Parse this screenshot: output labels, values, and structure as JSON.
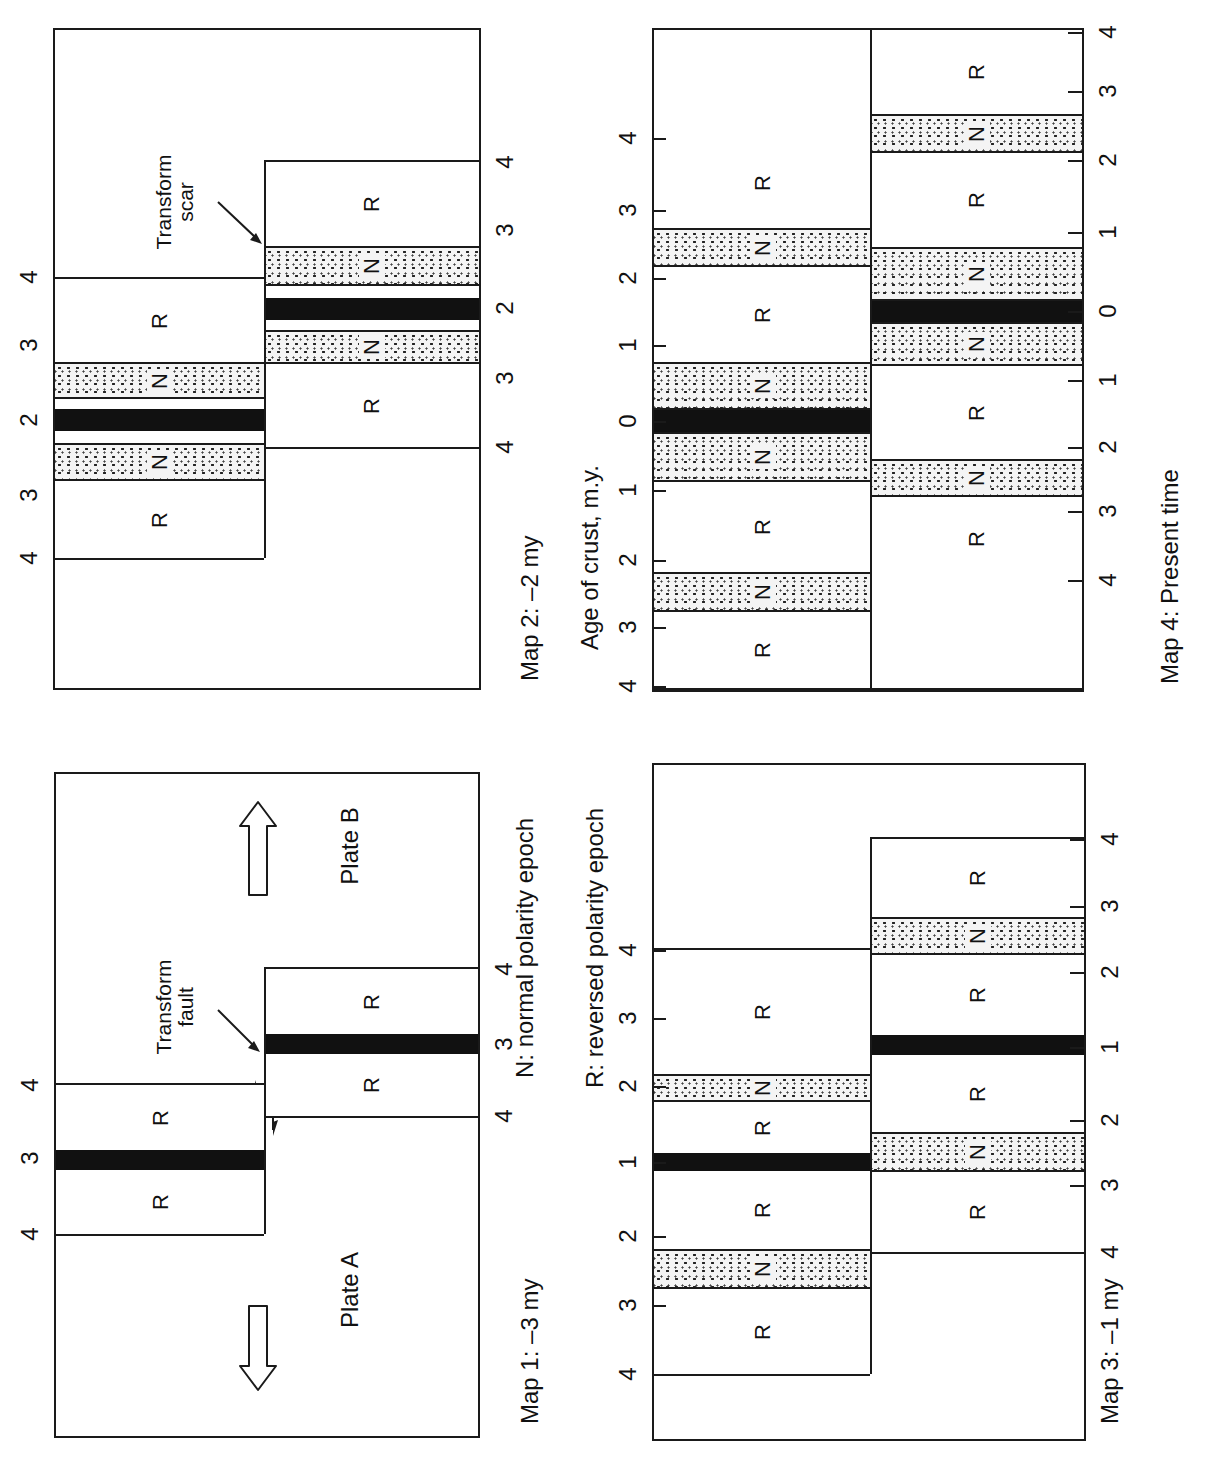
{
  "legend": {
    "normal": "N:  normal polarity epoch",
    "reversed": "R:  reversed polarity epoch"
  },
  "axis_title": "Age of crust, m.y.",
  "maps": [
    {
      "id": "map2",
      "caption": "Map 2:  –2 my",
      "box": {
        "x": 53,
        "y": 28,
        "w": 428,
        "h": 662
      },
      "fault_x": 264,
      "left_plate": {
        "y_top": 277,
        "y_bottom": 558
      },
      "right_plate": {
        "y_top": 160,
        "y_bottom": 447
      },
      "stripes_left": [
        {
          "type": "R",
          "y": 279,
          "h": 83,
          "label": "R"
        },
        {
          "type": "N",
          "y": 362,
          "h": 37,
          "label": "N"
        },
        {
          "type": "R",
          "y": 399,
          "h": 10,
          "label": ""
        },
        {
          "type": "B",
          "y": 409,
          "h": 22,
          "label": ""
        },
        {
          "type": "R",
          "y": 431,
          "h": 12,
          "label": ""
        },
        {
          "type": "N",
          "y": 443,
          "h": 38,
          "label": "N"
        },
        {
          "type": "R",
          "y": 481,
          "h": 77,
          "label": "R"
        }
      ],
      "stripes_right": [
        {
          "type": "R",
          "y": 162,
          "h": 84,
          "label": "R"
        },
        {
          "type": "N",
          "y": 246,
          "h": 40,
          "label": "N"
        },
        {
          "type": "R",
          "y": 286,
          "h": 12,
          "label": ""
        },
        {
          "type": "B",
          "y": 298,
          "h": 22,
          "label": ""
        },
        {
          "type": "R",
          "y": 320,
          "h": 10,
          "label": ""
        },
        {
          "type": "N",
          "y": 330,
          "h": 34,
          "label": "N"
        },
        {
          "type": "R",
          "y": 364,
          "h": 83,
          "label": "R"
        }
      ],
      "left_ticks": [
        {
          "label": "4",
          "y": 277
        },
        {
          "label": "3",
          "y": 345
        },
        {
          "label": "2",
          "y": 420
        },
        {
          "label": "3",
          "y": 495
        },
        {
          "label": "4",
          "y": 558
        }
      ],
      "right_ticks": [
        {
          "label": "4",
          "y": 162
        },
        {
          "label": "3",
          "y": 230
        },
        {
          "label": "2",
          "y": 308
        },
        {
          "label": "3",
          "y": 378
        },
        {
          "label": "4",
          "y": 447
        }
      ],
      "annotation": {
        "text_line1": "Transform",
        "text_line2": "scar"
      }
    },
    {
      "id": "map4",
      "caption": "Map 4:  Present time",
      "box": {
        "x": 652,
        "y": 28,
        "w": 432,
        "h": 662
      },
      "fault_x": 870,
      "left_plate": {
        "y_top": 28,
        "y_bottom": 690
      },
      "right_plate": {
        "y_top": 28,
        "y_bottom": 690
      },
      "stripes_left": [
        {
          "type": "R",
          "y": 30,
          "h": 108,
          "label": ""
        },
        {
          "type": "R",
          "y": 138,
          "h": 90,
          "label": "R"
        },
        {
          "type": "N",
          "y": 228,
          "h": 39,
          "label": "N"
        },
        {
          "type": "R",
          "y": 267,
          "h": 95,
          "label": "R"
        },
        {
          "type": "N",
          "y": 362,
          "h": 48,
          "label": "N"
        },
        {
          "type": "B",
          "y": 410,
          "h": 22,
          "label": ""
        },
        {
          "type": "N",
          "y": 432,
          "h": 50,
          "label": "N"
        },
        {
          "type": "R",
          "y": 482,
          "h": 90,
          "label": "R"
        },
        {
          "type": "N",
          "y": 572,
          "h": 40,
          "label": "N"
        },
        {
          "type": "R",
          "y": 612,
          "h": 76,
          "label": "R"
        }
      ],
      "stripes_right": [
        {
          "type": "R",
          "y": 30,
          "h": 84,
          "label": "R"
        },
        {
          "type": "N",
          "y": 114,
          "h": 39,
          "label": "N"
        },
        {
          "type": "R",
          "y": 153,
          "h": 94,
          "label": "R"
        },
        {
          "type": "N",
          "y": 247,
          "h": 54,
          "label": "N"
        },
        {
          "type": "B",
          "y": 301,
          "h": 21,
          "label": ""
        },
        {
          "type": "N",
          "y": 322,
          "h": 44,
          "label": "N"
        },
        {
          "type": "R",
          "y": 366,
          "h": 93,
          "label": "R"
        },
        {
          "type": "N",
          "y": 459,
          "h": 38,
          "label": "N"
        },
        {
          "type": "R",
          "y": 497,
          "h": 84,
          "label": "R"
        },
        {
          "type": "R",
          "y": 581,
          "h": 107,
          "label": ""
        }
      ],
      "left_ticks": [
        {
          "label": "4",
          "y": 138
        },
        {
          "label": "3",
          "y": 210
        },
        {
          "label": "2",
          "y": 278
        },
        {
          "label": "1",
          "y": 345
        },
        {
          "label": "0",
          "y": 421
        },
        {
          "label": "1",
          "y": 490
        },
        {
          "label": "2",
          "y": 560
        },
        {
          "label": "3",
          "y": 627
        },
        {
          "label": "4",
          "y": 686
        }
      ],
      "right_ticks": [
        {
          "label": "4",
          "y": 32
        },
        {
          "label": "3",
          "y": 91
        },
        {
          "label": "2",
          "y": 160
        },
        {
          "label": "1",
          "y": 232
        },
        {
          "label": "0",
          "y": 311
        },
        {
          "label": "1",
          "y": 380
        },
        {
          "label": "2",
          "y": 447
        },
        {
          "label": "3",
          "y": 511
        },
        {
          "label": "4",
          "y": 580
        }
      ]
    },
    {
      "id": "map1",
      "caption": "Map 1:  –3 my",
      "box": {
        "x": 54,
        "y": 772,
        "w": 426,
        "h": 666
      },
      "fault_x": 264,
      "left_plate": {
        "y_top": 1083,
        "y_bottom": 1234
      },
      "right_plate": {
        "y_top": 967,
        "y_bottom": 1116
      },
      "stripes_left": [
        {
          "type": "R",
          "y": 1085,
          "h": 65,
          "label": "R"
        },
        {
          "type": "B",
          "y": 1150,
          "h": 20,
          "label": ""
        },
        {
          "type": "R",
          "y": 1170,
          "h": 64,
          "label": "R"
        }
      ],
      "stripes_right": [
        {
          "type": "R",
          "y": 969,
          "h": 65,
          "label": "R"
        },
        {
          "type": "B",
          "y": 1034,
          "h": 20,
          "label": ""
        },
        {
          "type": "R",
          "y": 1054,
          "h": 62,
          "label": "R"
        }
      ],
      "left_ticks": [
        {
          "label": "4",
          "y": 1085
        },
        {
          "label": "3",
          "y": 1158
        },
        {
          "label": "4",
          "y": 1234
        }
      ],
      "right_ticks": [
        {
          "label": "4",
          "y": 969
        },
        {
          "label": "3",
          "y": 1044
        },
        {
          "label": "4",
          "y": 1116
        }
      ],
      "annotation": {
        "text_line1": "Transform",
        "text_line2": "fault"
      },
      "plate_a": "Plate A",
      "plate_b": "Plate B"
    },
    {
      "id": "map3",
      "caption": "Map 3:  –1 my",
      "box": {
        "x": 652,
        "y": 763,
        "w": 434,
        "h": 678
      },
      "fault_x": 870,
      "left_plate": {
        "y_top": 948,
        "y_bottom": 1374
      },
      "right_plate": {
        "y_top": 837,
        "y_bottom": 1252
      },
      "stripes_left": [
        {
          "type": "R",
          "y": 950,
          "h": 124,
          "label": "R"
        },
        {
          "type": "N",
          "y": 1074,
          "h": 28,
          "label": "N"
        },
        {
          "type": "R",
          "y": 1102,
          "h": 51,
          "label": "R"
        },
        {
          "type": "B",
          "y": 1153,
          "h": 18,
          "label": ""
        },
        {
          "type": "R",
          "y": 1171,
          "h": 78,
          "label": "R"
        },
        {
          "type": "N",
          "y": 1249,
          "h": 40,
          "label": "N"
        },
        {
          "type": "R",
          "y": 1289,
          "h": 85,
          "label": "R"
        }
      ],
      "stripes_right": [
        {
          "type": "R",
          "y": 839,
          "h": 78,
          "label": "R"
        },
        {
          "type": "N",
          "y": 917,
          "h": 38,
          "label": "N"
        },
        {
          "type": "R",
          "y": 955,
          "h": 80,
          "label": "R"
        },
        {
          "type": "B",
          "y": 1035,
          "h": 20,
          "label": ""
        },
        {
          "type": "R",
          "y": 1055,
          "h": 77,
          "label": "R"
        },
        {
          "type": "N",
          "y": 1132,
          "h": 40,
          "label": "N"
        },
        {
          "type": "R",
          "y": 1172,
          "h": 80,
          "label": "R"
        }
      ],
      "left_ticks": [
        {
          "label": "4",
          "y": 950
        },
        {
          "label": "3",
          "y": 1018
        },
        {
          "label": "2",
          "y": 1086
        },
        {
          "label": "1",
          "y": 1162
        },
        {
          "label": "2",
          "y": 1236
        },
        {
          "label": "3",
          "y": 1305
        },
        {
          "label": "4",
          "y": 1374
        }
      ],
      "right_ticks": [
        {
          "label": "4",
          "y": 839
        },
        {
          "label": "3",
          "y": 906
        },
        {
          "label": "2",
          "y": 972
        },
        {
          "label": "1",
          "y": 1047
        },
        {
          "label": "2",
          "y": 1120
        },
        {
          "label": "3",
          "y": 1185
        },
        {
          "label": "4",
          "y": 1252
        }
      ]
    }
  ],
  "colors": {
    "ink": "#1a1a1a",
    "background": "#ffffff",
    "stipple_bg": "#f4f4f4"
  }
}
